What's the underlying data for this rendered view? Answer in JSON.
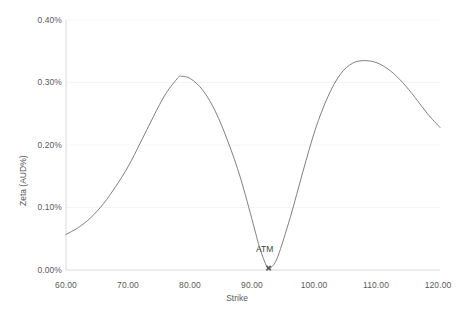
{
  "chart_data": {
    "type": "line",
    "title": "",
    "xlabel": "Strike",
    "ylabel": "Zeta (AUD%)",
    "xlim": [
      60.0,
      120.0
    ],
    "ylim": [
      0.0,
      0.4
    ],
    "xticks": [
      "60.00",
      "70.00",
      "80.00",
      "90.00",
      "100.00",
      "110.00",
      "120.00"
    ],
    "xtick_values": [
      60,
      70,
      80,
      90,
      100,
      110,
      120
    ],
    "yticks": [
      "0.00%",
      "0.10%",
      "0.20%",
      "0.30%",
      "0.40%"
    ],
    "ytick_values": [
      0.0,
      0.1,
      0.2,
      0.3,
      0.4
    ],
    "grid": "horizontal-faint",
    "legend": "none",
    "line_color": "#808080",
    "series": [
      {
        "name": "Zeta",
        "x": [
          60,
          62,
          64,
          66,
          68,
          70,
          72,
          74,
          76,
          78,
          78.5,
          80,
          82,
          84,
          86,
          88,
          90,
          91,
          92,
          92.5,
          93,
          94,
          96,
          98,
          100,
          102,
          104,
          106,
          108,
          110,
          112,
          114,
          116,
          118,
          120
        ],
        "values": [
          0.057,
          0.068,
          0.084,
          0.106,
          0.134,
          0.166,
          0.205,
          0.245,
          0.282,
          0.308,
          0.31,
          0.306,
          0.287,
          0.253,
          0.205,
          0.147,
          0.075,
          0.038,
          0.01,
          0.003,
          0.005,
          0.022,
          0.085,
          0.157,
          0.225,
          0.277,
          0.313,
          0.331,
          0.335,
          0.331,
          0.319,
          0.3,
          0.276,
          0.25,
          0.228
        ]
      }
    ],
    "annotations": [
      {
        "label": "ATM",
        "x": 92.5,
        "y": 0.003,
        "marker": "cross"
      }
    ]
  },
  "axis": {
    "y_title": "Zeta (AUD%)",
    "x_title": "Strike"
  }
}
